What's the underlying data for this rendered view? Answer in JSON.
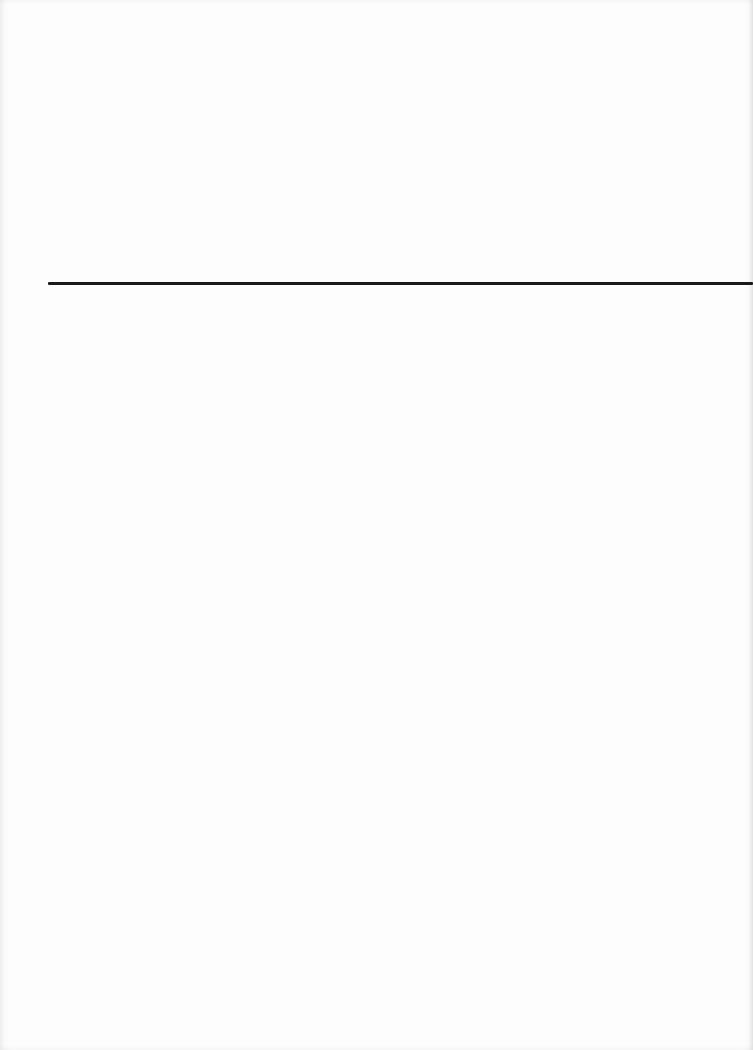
{
  "page": {
    "type": "scanned-blank-page",
    "background_color": "#fdfdfd",
    "elements": [
      {
        "kind": "horizontal-rule",
        "color": "#1a1a1a"
      }
    ]
  }
}
